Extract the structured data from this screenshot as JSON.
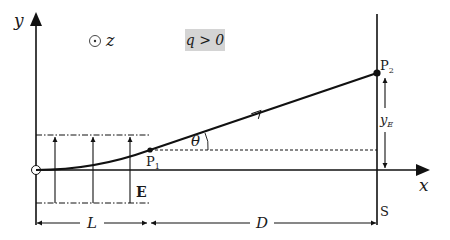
{
  "diagram": {
    "type": "charged particle deflection in uniform electric field",
    "axes": {
      "x_label": "x",
      "y_label": "y",
      "z_symbol": "⊙",
      "z_label": "z"
    },
    "condition_label": "q > 0",
    "field_label": "E",
    "points": {
      "p1": {
        "label": "P",
        "subscript": "1"
      },
      "p2": {
        "label": "P",
        "subscript": "2"
      }
    },
    "angle_label": "θ)",
    "deflection_label": {
      "main": "y",
      "subscript": "E"
    },
    "screen_label": "S",
    "dimensions": {
      "field_length": "L",
      "drift_distance": "D"
    },
    "colors": {
      "line": "#111111",
      "condition_bg": "#d4d4d4",
      "background": "#ffffff"
    }
  }
}
